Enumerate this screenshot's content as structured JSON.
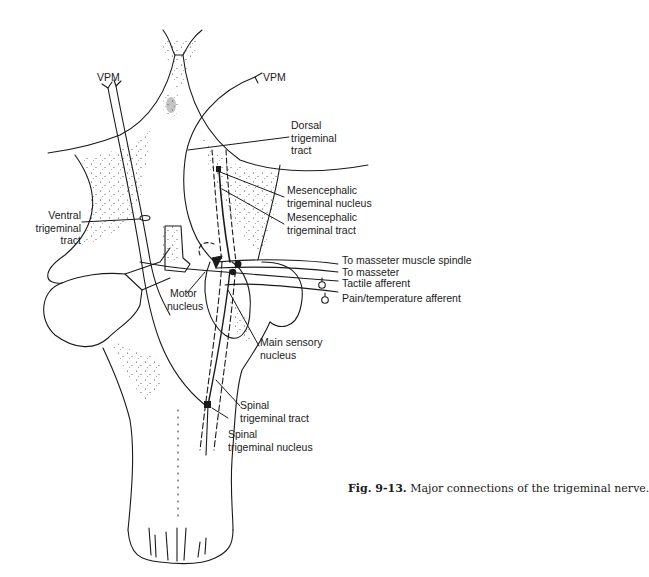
{
  "figure": {
    "caption_number": "Fig. 9-13.",
    "caption_text": " Major connections of the trigeminal nerve.",
    "colors": {
      "ink": "#1a1a1a",
      "background": "#ffffff"
    }
  },
  "labels": {
    "vpm_left": "VPM",
    "vpm_right": "VPM",
    "dorsal_tract": [
      "Dorsal",
      "trigeminal",
      "tract"
    ],
    "mes_nucleus": [
      "Mesencephalic",
      "trigeminal nucleus"
    ],
    "mes_tract": [
      "Mesencephalic",
      "trigeminal tract"
    ],
    "ventral_tract": [
      "Ventral",
      "trigeminal",
      "tract"
    ],
    "to_spindle": "To masseter muscle spindle",
    "to_masseter": "To masseter",
    "tactile": "Tactile afferent",
    "pain": "Pain/temperature afferent",
    "motor_nucleus": [
      "Motor",
      "nucleus"
    ],
    "main_sensory": [
      "Main sensory",
      "nucleus"
    ],
    "spinal_tract": [
      "Spinal",
      "trigeminal tract"
    ],
    "spinal_nucleus": [
      "Spinal",
      "trigeminal nucleus"
    ]
  }
}
